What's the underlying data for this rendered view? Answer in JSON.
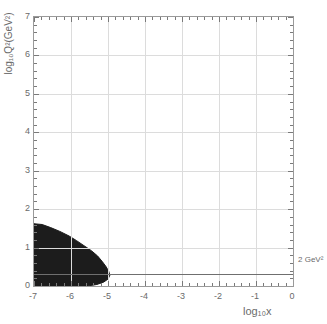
{
  "chart_data": {
    "type": "area",
    "title": "",
    "xlabel": "log10x",
    "xlabel_display": "log₁₀x",
    "ylabel": "log10Q2(GeV2)",
    "ylabel_display": "log₁₀Q²(GeV²)",
    "xlim": [
      -7,
      0
    ],
    "ylim": [
      0,
      7
    ],
    "grid": true,
    "legend": "none",
    "xticks": [
      -7,
      -6,
      -5,
      -4,
      -3,
      -2,
      -1,
      0
    ],
    "xtick_labels": [
      "-7",
      "-6",
      "-5",
      "-4",
      "-3",
      "-2",
      "-1",
      "0"
    ],
    "yticks": [
      0,
      1,
      2,
      3,
      4,
      5,
      6,
      7
    ],
    "ytick_labels": [
      "0",
      "1",
      "2",
      "3",
      "4",
      "5",
      "6",
      "7"
    ],
    "xminor_per_major": 5,
    "yminor_per_major": 5,
    "annotations": [
      {
        "text": "2 GeV²",
        "x": 0.05,
        "y": 0.3,
        "placement": "right-outside",
        "kind": "threshold-label"
      }
    ],
    "reference_lines": [
      {
        "orientation": "horizontal",
        "y": 0.3,
        "label": "2 GeV²",
        "color": "#6f6f6f",
        "style": "solid"
      }
    ],
    "series": [
      {
        "name": "kinematic-acceptance-region",
        "type": "filled-polygon",
        "color": "#1c1c1c",
        "fill": "#1c1c1c",
        "description": "dark filled wedge of accepted kinematic phase space",
        "polygon": [
          [
            -7.0,
            0.0
          ],
          [
            -7.0,
            1.62
          ],
          [
            -6.78,
            1.6
          ],
          [
            -6.55,
            1.52
          ],
          [
            -6.3,
            1.42
          ],
          [
            -6.05,
            1.3
          ],
          [
            -5.85,
            1.18
          ],
          [
            -5.65,
            1.05
          ],
          [
            -5.45,
            0.92
          ],
          [
            -5.28,
            0.78
          ],
          [
            -5.15,
            0.63
          ],
          [
            -5.05,
            0.5
          ],
          [
            -4.98,
            0.38
          ],
          [
            -4.95,
            0.28
          ],
          [
            -5.0,
            0.18
          ],
          [
            -5.12,
            0.1
          ],
          [
            -5.3,
            0.04
          ],
          [
            -5.55,
            0.0
          ]
        ]
      }
    ]
  },
  "axes": {
    "y_title": "log₁₀Q²(GeV²)",
    "x_title": "log₁₀x"
  },
  "labels": {
    "threshold": "2 GeV²"
  }
}
